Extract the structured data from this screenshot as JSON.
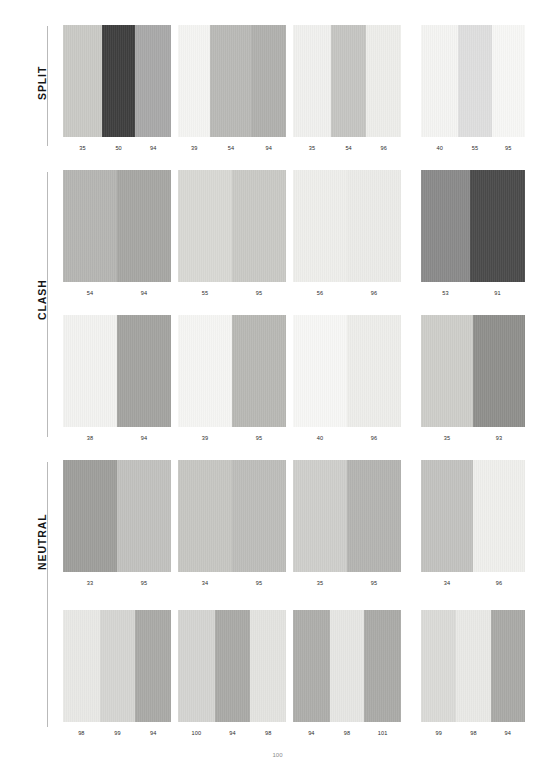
{
  "page": {
    "background": "#ffffff",
    "width": 555,
    "height": 763
  },
  "sections": [
    {
      "label": "SPLIT",
      "rows": [
        {
          "cards": [
            {
              "bands": [
                {
                  "color": "#c9c9c5",
                  "width": 0.36,
                  "label": "35"
                },
                {
                  "color": "#3e3e3e",
                  "width": 0.31,
                  "label": "50"
                },
                {
                  "color": "#a8a8a8",
                  "width": 0.33,
                  "label": "94"
                }
              ]
            },
            {
              "bands": [
                {
                  "color": "#f4f4f2",
                  "width": 0.3,
                  "label": "39"
                },
                {
                  "color": "#b9b9b6",
                  "width": 0.38,
                  "label": "54"
                },
                {
                  "color": "#b0b0ad",
                  "width": 0.32,
                  "label": "94"
                }
              ]
            },
            {
              "bands": [
                {
                  "color": "#f0f0ee",
                  "width": 0.35,
                  "label": "35"
                },
                {
                  "color": "#c5c5c2",
                  "width": 0.33,
                  "label": "54"
                },
                {
                  "color": "#ededea",
                  "width": 0.32,
                  "label": "96"
                }
              ]
            },
            {
              "bands": [
                {
                  "color": "#f4f4f2",
                  "width": 0.36,
                  "label": "40"
                },
                {
                  "color": "#dedede",
                  "width": 0.32,
                  "label": "55"
                },
                {
                  "color": "#f7f7f5",
                  "width": 0.32,
                  "label": "95"
                }
              ]
            }
          ]
        }
      ]
    },
    {
      "label": "CLASH",
      "rows": [
        {
          "cards": [
            {
              "bands": [
                {
                  "color": "#b5b5b2",
                  "width": 0.5,
                  "label": "54"
                },
                {
                  "color": "#a6a6a3",
                  "width": 0.5,
                  "label": "94"
                }
              ]
            },
            {
              "bands": [
                {
                  "color": "#d8d8d4",
                  "width": 0.5,
                  "label": "55"
                },
                {
                  "color": "#c9c9c5",
                  "width": 0.5,
                  "label": "95"
                }
              ]
            },
            {
              "bands": [
                {
                  "color": "#eeeeeb",
                  "width": 0.5,
                  "label": "56"
                },
                {
                  "color": "#ebebe8",
                  "width": 0.5,
                  "label": "96"
                }
              ]
            },
            {
              "bands": [
                {
                  "color": "#8a8a8a",
                  "width": 0.47,
                  "label": "53"
                },
                {
                  "color": "#4a4a4a",
                  "width": 0.53,
                  "label": "91"
                }
              ]
            }
          ]
        },
        {
          "cards": [
            {
              "bands": [
                {
                  "color": "#f2f2f0",
                  "width": 0.5,
                  "label": "38"
                },
                {
                  "color": "#a3a3a0",
                  "width": 0.5,
                  "label": "94"
                }
              ]
            },
            {
              "bands": [
                {
                  "color": "#f5f5f3",
                  "width": 0.5,
                  "label": "39"
                },
                {
                  "color": "#b8b8b4",
                  "width": 0.5,
                  "label": "95"
                }
              ]
            },
            {
              "bands": [
                {
                  "color": "#f7f7f5",
                  "width": 0.5,
                  "label": "40"
                },
                {
                  "color": "#ededea",
                  "width": 0.5,
                  "label": "96"
                }
              ]
            },
            {
              "bands": [
                {
                  "color": "#cdcdc9",
                  "width": 0.5,
                  "label": "35"
                },
                {
                  "color": "#8f8f8c",
                  "width": 0.5,
                  "label": "93"
                }
              ]
            }
          ]
        }
      ]
    },
    {
      "label": "NEUTRAL",
      "rows": [
        {
          "cards": [
            {
              "bands": [
                {
                  "color": "#9e9e9b",
                  "width": 0.5,
                  "label": "33"
                },
                {
                  "color": "#c1c1be",
                  "width": 0.5,
                  "label": "95"
                }
              ]
            },
            {
              "bands": [
                {
                  "color": "#c6c6c2",
                  "width": 0.5,
                  "label": "34"
                },
                {
                  "color": "#bdbdba",
                  "width": 0.5,
                  "label": "95"
                }
              ]
            },
            {
              "bands": [
                {
                  "color": "#cececb",
                  "width": 0.5,
                  "label": "35"
                },
                {
                  "color": "#b4b4b1",
                  "width": 0.5,
                  "label": "95"
                }
              ]
            },
            {
              "bands": [
                {
                  "color": "#c2c2bf",
                  "width": 0.5,
                  "label": "34"
                },
                {
                  "color": "#efefec",
                  "width": 0.5,
                  "label": "96"
                }
              ]
            }
          ]
        },
        {
          "cards": [
            {
              "bands": [
                {
                  "color": "#e8e8e5",
                  "width": 0.34,
                  "label": "98"
                },
                {
                  "color": "#d5d5d2",
                  "width": 0.33,
                  "label": "99"
                },
                {
                  "color": "#a9a9a6",
                  "width": 0.33,
                  "label": "94"
                }
              ]
            },
            {
              "bands": [
                {
                  "color": "#d4d4d1",
                  "width": 0.34,
                  "label": "100"
                },
                {
                  "color": "#a9a9a6",
                  "width": 0.33,
                  "label": "94"
                },
                {
                  "color": "#e3e3e0",
                  "width": 0.33,
                  "label": "98"
                }
              ]
            },
            {
              "bands": [
                {
                  "color": "#adadaa",
                  "width": 0.34,
                  "label": "94"
                },
                {
                  "color": "#e6e6e3",
                  "width": 0.32,
                  "label": "98"
                },
                {
                  "color": "#aaaaa7",
                  "width": 0.34,
                  "label": "101"
                }
              ]
            },
            {
              "bands": [
                {
                  "color": "#dadad7",
                  "width": 0.34,
                  "label": "99"
                },
                {
                  "color": "#e9e9e6",
                  "width": 0.33,
                  "label": "98"
                },
                {
                  "color": "#a9a9a6",
                  "width": 0.33,
                  "label": "94"
                }
              ]
            }
          ]
        }
      ]
    }
  ],
  "footer": {
    "page_number": "100"
  }
}
